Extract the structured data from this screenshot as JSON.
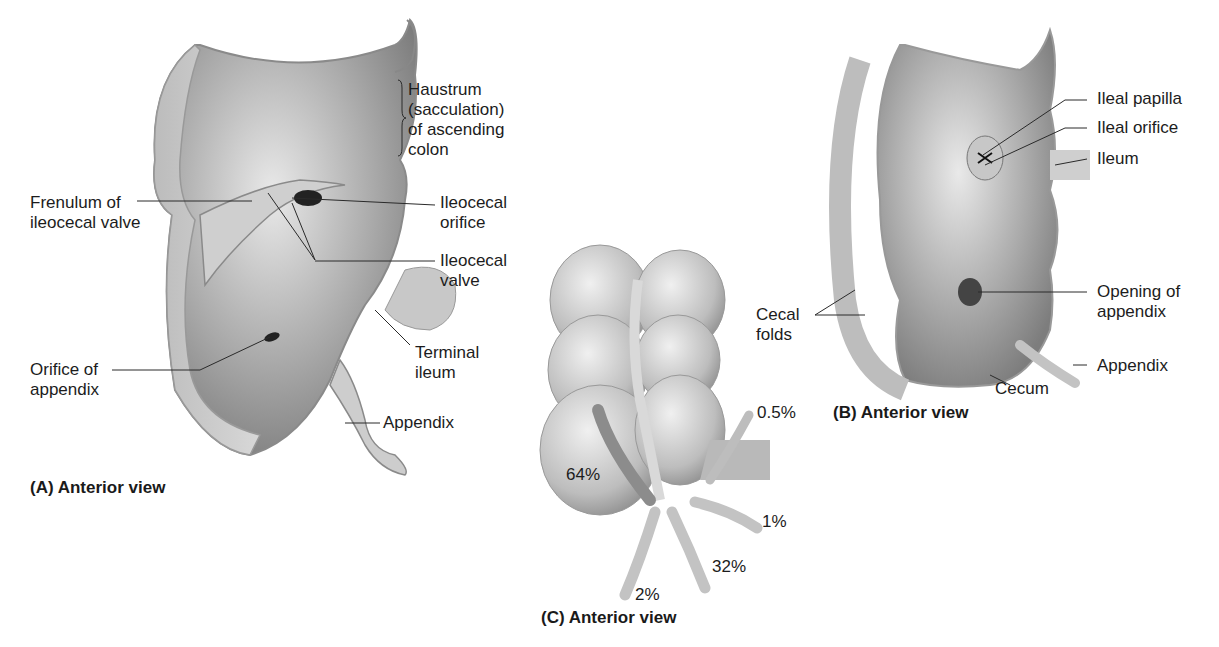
{
  "figure": {
    "panels": [
      {
        "id": "A",
        "caption": "(A) Anterior view",
        "labels": {
          "haustrum": "Haustrum\n(sacculation)\nof ascending\ncolon",
          "frenulum": "Frenulum of\nileocecal valve",
          "ileocecal_orifice": "Ileocecal\norifice",
          "ileocecal_valve": "Ileocecal\nvalve",
          "orifice_appendix": "Orifice of\nappendix",
          "terminal_ileum": "Terminal\nileum",
          "appendix": "Appendix"
        }
      },
      {
        "id": "B",
        "caption": "(B) Anterior view",
        "labels": {
          "ileal_papilla": "Ileal papilla",
          "ileal_orifice": "Ileal orifice",
          "ileum": "Ileum",
          "opening_appendix": "Opening of\nappendix",
          "cecal_folds": "Cecal\nfolds",
          "appendix": "Appendix",
          "cecum": "Cecum"
        }
      },
      {
        "id": "C",
        "caption": "(C) Anterior view",
        "percentages": {
          "retrocecal": "64%",
          "pelvic": "32%",
          "subcecal": "2%",
          "postileal": "1%",
          "preileal": "0.5%"
        }
      }
    ]
  }
}
